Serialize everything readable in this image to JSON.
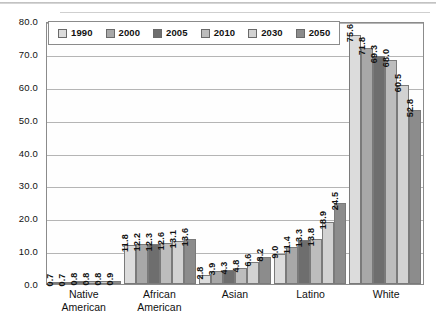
{
  "chart_data": {
    "type": "bar",
    "title": "",
    "subtitle": "",
    "xlabel": "",
    "ylabel": "",
    "ylim": [
      0,
      80
    ],
    "ytick_step": 10,
    "ytick_labels": [
      "0.0",
      "10.0",
      "20.0",
      "30.0",
      "40.0",
      "50.0",
      "60.0",
      "70.0",
      "80.0"
    ],
    "grid": true,
    "legend_position": "top-left-inside",
    "categories": [
      "Native American",
      "African American",
      "Asian",
      "Latino",
      "White"
    ],
    "category_lines": [
      [
        "Native",
        "American"
      ],
      [
        "African",
        "American"
      ],
      [
        "Asian",
        ""
      ],
      [
        "Latino",
        ""
      ],
      [
        "White",
        ""
      ]
    ],
    "series": [
      {
        "name": "1990",
        "color": "#dcdcdc",
        "values": [
          0.7,
          11.8,
          2.8,
          9.0,
          75.6
        ]
      },
      {
        "name": "2000",
        "color": "#a8a8a8",
        "values": [
          0.7,
          12.2,
          3.9,
          11.4,
          71.8
        ]
      },
      {
        "name": "2005",
        "color": "#6e6e6e",
        "values": [
          0.8,
          12.3,
          4.3,
          13.3,
          69.3
        ]
      },
      {
        "name": "2010",
        "color": "#bdbdbd",
        "values": [
          0.8,
          12.6,
          4.8,
          13.8,
          68.0
        ]
      },
      {
        "name": "2030",
        "color": "#d2d2d2",
        "values": [
          0.8,
          13.1,
          6.6,
          18.9,
          60.5
        ]
      },
      {
        "name": "2050",
        "color": "#8c8c8c",
        "values": [
          0.9,
          13.6,
          8.2,
          24.5,
          52.8
        ]
      }
    ],
    "value_labels": {
      "Native American": [
        "0.7",
        "0.7",
        "0.8",
        "0.8",
        "0.8",
        "0.9"
      ],
      "African American": [
        "11.8",
        "12.2",
        "12.3",
        "12.6",
        "13.1",
        "13.6"
      ],
      "Asian": [
        "2.8",
        "3.9",
        "4.3",
        "4.8",
        "6.6",
        "8.2"
      ],
      "Latino": [
        "9.0",
        "11.4",
        "13.3",
        "13.8",
        "18.9",
        "24.5"
      ],
      "White": [
        "75.6",
        "71.8",
        "69.3",
        "68.0",
        "60.5",
        "52.8"
      ]
    }
  },
  "legend": {
    "items": [
      {
        "label": "1990"
      },
      {
        "label": "2000"
      },
      {
        "label": "2005"
      },
      {
        "label": "2010"
      },
      {
        "label": "2030"
      },
      {
        "label": "2050"
      }
    ]
  },
  "colors": {
    "frame": "#8b8b8b",
    "gridline": "#b5b5b5",
    "text": "#111111",
    "background": "#ffffff"
  }
}
